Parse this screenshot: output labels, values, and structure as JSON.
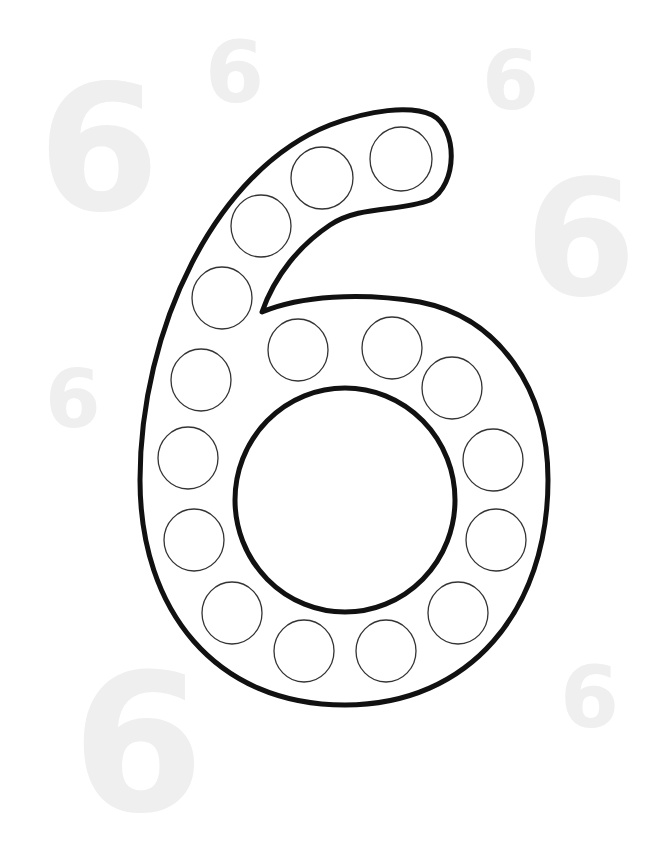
{
  "worksheet": {
    "numeral": "6",
    "dot_count": 16,
    "outline_color": "#111111",
    "dot_stroke_color": "#333333",
    "background_numeral_color": "#eeeeee"
  },
  "background_numerals": [
    {
      "text": "6",
      "x": 38,
      "y": 62,
      "size": 175
    },
    {
      "text": "6",
      "x": 205,
      "y": 30,
      "size": 85
    },
    {
      "text": "6",
      "x": 482,
      "y": 40,
      "size": 82
    },
    {
      "text": "6",
      "x": 525,
      "y": 160,
      "size": 160
    },
    {
      "text": "6",
      "x": 45,
      "y": 360,
      "size": 80
    },
    {
      "text": "6",
      "x": 72,
      "y": 650,
      "size": 190
    },
    {
      "text": "6",
      "x": 560,
      "y": 655,
      "size": 85
    }
  ]
}
